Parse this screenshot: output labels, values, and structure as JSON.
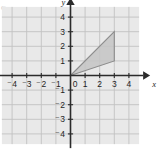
{
  "figure": {
    "corner_mark": "C",
    "background_color": "#ffffff",
    "grid_fill_color": "#e9e9e9",
    "grid_line_color": "#c2c2c2",
    "axis_color": "#2b2b2b",
    "label_color": "#1f1f1f",
    "shape_fill_color": "#c4c4c4",
    "shape_stroke_color": "#8c8c8c"
  },
  "chart_data": {
    "type": "scatter",
    "title": "",
    "subtitle": "",
    "xlabel": "x",
    "ylabel": "y",
    "xlim": [
      -4.7,
      4.7
    ],
    "ylim": [
      -4.7,
      4.7
    ],
    "grid": true,
    "grid_step": 1,
    "legend": "none",
    "axis_arrows": [
      "x-positive",
      "y-positive"
    ],
    "origin_label": "0",
    "x_tick_values": [
      -4,
      -3,
      -2,
      -1,
      1,
      2,
      3,
      4
    ],
    "x_tick_labels": [
      "⁻4",
      "⁻3",
      "⁻2",
      "⁻1",
      "1",
      "2",
      "3",
      "4"
    ],
    "y_tick_values": [
      4,
      3,
      2,
      1,
      -1,
      -2,
      -3,
      -4
    ],
    "y_tick_labels": [
      "4",
      "3",
      "2",
      "1",
      "⁻1",
      "⁻2",
      "⁻3",
      "⁻4"
    ],
    "shapes": [
      {
        "name": "shaded-triangle",
        "type": "polygon",
        "vertices": [
          [
            0,
            0
          ],
          [
            3,
            1
          ],
          [
            3,
            3
          ]
        ],
        "filled": true
      }
    ]
  }
}
